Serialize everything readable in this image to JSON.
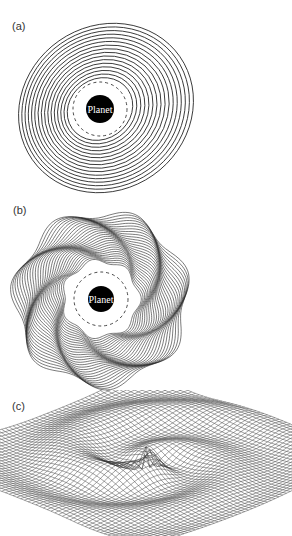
{
  "figure": {
    "panels": [
      {
        "label": "(a)",
        "planet_label": "Planet",
        "description": "Nested eccentric elliptical streamlines around planet with dashed circle"
      },
      {
        "label": "(b)",
        "planet_label": "Planet",
        "description": "Nested polygonal wavy streamlines around planet with dashed circle"
      },
      {
        "label": "(c)",
        "description": "3D wireframe surface showing spiral density waves"
      }
    ]
  }
}
